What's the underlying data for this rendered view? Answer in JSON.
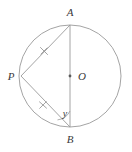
{
  "figure": {
    "background_color": "#ffffff",
    "stroke_color": "#9a9a9a",
    "label_color": "#3a3a3a",
    "circle": {
      "center_label": "O",
      "center_x": 70,
      "center_y": 76,
      "radius": 51
    },
    "points": [
      {
        "name": "point-a",
        "label": "A",
        "x": 70,
        "y": 25,
        "label_x": 70,
        "label_y": 14
      },
      {
        "name": "point-b",
        "label": "B",
        "x": 70,
        "y": 127,
        "label_x": 70,
        "label_y": 143
      },
      {
        "name": "point-p",
        "label": "P",
        "x": 21,
        "y": 76,
        "label_x": 11,
        "label_y": 80
      },
      {
        "name": "point-o",
        "label": "O",
        "x": 70,
        "y": 76,
        "label_x": 81,
        "label_y": 80
      }
    ],
    "segments": [
      {
        "name": "segment-ab",
        "from": "A",
        "to": "B",
        "x1": 70,
        "y1": 25,
        "x2": 70,
        "y2": 127
      },
      {
        "name": "segment-pa",
        "from": "P",
        "to": "A",
        "x1": 21,
        "y1": 76,
        "x2": 70,
        "y2": 25
      },
      {
        "name": "segment-pb",
        "from": "P",
        "to": "B",
        "x1": 21,
        "y1": 76,
        "x2": 70,
        "y2": 127
      }
    ],
    "tick_marks": [
      {
        "name": "tick-mark-pa",
        "on_segment": "PA",
        "count": 1,
        "x": 44,
        "y": 51
      },
      {
        "name": "tick-mark-pb",
        "on_segment": "PB",
        "count": 1,
        "x": 43,
        "y": 105
      }
    ],
    "angle": {
      "name": "angle-y-at-b",
      "label": "y",
      "vertex": "B",
      "between": [
        "BP",
        "BA"
      ],
      "label_x": 68,
      "label_y": 117,
      "arc_radius": 16
    },
    "center_dot": {
      "name": "center-dot-o",
      "x": 70,
      "y": 76,
      "radius": 1.4
    }
  }
}
